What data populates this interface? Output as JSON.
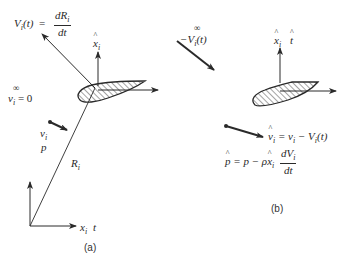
{
  "figure": {
    "panel_a": {
      "caption": "(a)",
      "velocity_eq_lhs": "V",
      "velocity_eq_lhs_sub": "i",
      "velocity_eq_lhs_arg": "(t)",
      "velocity_eq_equals": "=",
      "velocity_eq_num": "dR",
      "velocity_eq_num_sub": "i",
      "velocity_eq_den": "dt",
      "body_axis_label": "x",
      "body_axis_sub": "i",
      "freestream_symbol": "∞",
      "freestream_label": "v",
      "freestream_sub": "i",
      "freestream_value": "= 0",
      "local_velocity_label": "v",
      "local_velocity_sub": "i",
      "pressure_label": "p",
      "position_label": "R",
      "position_sub": "i",
      "inertial_axis_label": "x",
      "inertial_axis_sub": "i",
      "time_label": "t"
    },
    "panel_b": {
      "caption": "(b)",
      "freestream_symbol": "∞",
      "freestream_label": "−V",
      "freestream_sub": "i",
      "freestream_arg": "(t)",
      "body_axis_label": "x",
      "body_axis_sub": "i",
      "time_label": "t",
      "rel_velocity_lhs": "v",
      "rel_velocity_sub": "i",
      "rel_velocity_rhs": "= v",
      "rel_velocity_rhs_sub": "i",
      "rel_velocity_rhs2": " − V",
      "rel_velocity_rhs2_sub": "i",
      "rel_velocity_rhs2_arg": "(t)",
      "pressure_lhs": "p",
      "pressure_rhs": "= p − ρ",
      "pressure_x": "x",
      "pressure_x_sub": "i",
      "pressure_num": "dV",
      "pressure_num_sub": "i",
      "pressure_den": "dt"
    },
    "colors": {
      "line": "#2a2a2a",
      "hatch": "#333333",
      "background": "#ffffff"
    }
  }
}
